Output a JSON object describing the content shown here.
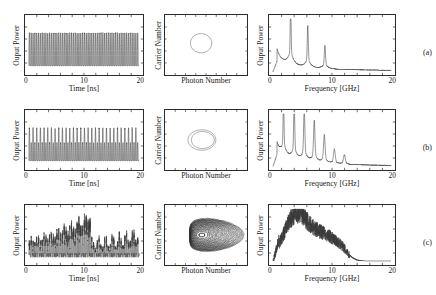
{
  "figure": {
    "panel_labels": [
      "(a)",
      "(b)",
      "(c)"
    ],
    "columns": [
      "time-series",
      "phase-portrait",
      "rf-spectrum"
    ]
  },
  "chart_data": [
    {
      "type": "line",
      "panel": "(a)",
      "column": "time-series",
      "title": "",
      "xlabel": "Time [ns]",
      "ylabel": "Ouput Power",
      "xlim": [
        0,
        20
      ],
      "xticks": [
        0,
        10,
        20
      ],
      "xticklabels": [
        "0",
        "10",
        "20"
      ],
      "yticks": [],
      "grid": false,
      "description": "Period-one limit-cycle oscillation, constant amplitude relaxation oscillation at about 3 GHz",
      "waveform": {
        "kind": "periodic",
        "freq_ghz": 3.0,
        "amplitude": 1.0,
        "amplitude_jitter": 0.04,
        "baseline": 0.42
      }
    },
    {
      "type": "scatter",
      "panel": "(a)",
      "column": "phase-portrait",
      "xlabel": "Photon Number",
      "ylabel": "Carrier Number",
      "grid": false,
      "description": "Single closed orbit (period-one limit cycle)",
      "orbit": {
        "kind": "loops",
        "loops": 1,
        "rx": 0.13,
        "ry": 0.16,
        "cx": 0.44,
        "cy": 0.47,
        "spread": 0.0
      }
    },
    {
      "type": "line",
      "panel": "(a)",
      "column": "rf-spectrum",
      "xlabel": "Frequency [GHz]",
      "ylabel": "Ouput Power",
      "xlim": [
        0,
        20
      ],
      "xticks": [
        0,
        10,
        20
      ],
      "xticklabels": [
        "0",
        "10",
        "20"
      ],
      "yticks": [],
      "grid": false,
      "description": "Sharp fundamental peak near 3 GHz with decaying harmonics at 6 and 9 GHz on a smooth decaying background",
      "peaks_ghz": [
        3.0,
        5.9,
        8.8
      ],
      "peak_heights": [
        0.95,
        0.62,
        0.34
      ],
      "background": "monotonic decay"
    },
    {
      "type": "line",
      "panel": "(b)",
      "column": "time-series",
      "title": "",
      "xlabel": "Time [ns]",
      "ylabel": "Ouput Power",
      "xlim": [
        0,
        20
      ],
      "xticks": [
        0,
        10,
        20
      ],
      "xticklabels": [
        "0",
        "10",
        "20"
      ],
      "yticks": [],
      "grid": false,
      "description": "Period-doubled oscillation, alternating tall and short pulses",
      "waveform": {
        "kind": "period-doubled",
        "freq_ghz": 3.0,
        "amplitude": 1.0,
        "alt_ratio": 0.55,
        "amplitude_jitter": 0.05,
        "baseline": 0.42
      }
    },
    {
      "type": "scatter",
      "panel": "(b)",
      "column": "phase-portrait",
      "xlabel": "Photon Number",
      "ylabel": "Carrier Number",
      "grid": false,
      "description": "Double-loop orbit characteristic of period-two dynamics",
      "orbit": {
        "kind": "loops",
        "loops": 2,
        "rx": 0.17,
        "ry": 0.17,
        "cx": 0.45,
        "cy": 0.5,
        "spread": 0.4
      }
    },
    {
      "type": "line",
      "panel": "(b)",
      "column": "rf-spectrum",
      "xlabel": "Frequency [GHz]",
      "ylabel": "Ouput Power",
      "xlim": [
        0,
        20
      ],
      "xticks": [
        0,
        10,
        20
      ],
      "xticklabels": [
        "0",
        "10",
        "20"
      ],
      "yticks": [],
      "grid": false,
      "description": "Comb of sharp peaks at half-integer multiples of the relaxation frequency, indicating period doubling",
      "peaks_ghz": [
        1.8,
        3.6,
        5.3,
        7.0,
        8.7,
        10.4,
        12.1
      ],
      "peak_heights": [
        0.9,
        0.88,
        0.8,
        0.62,
        0.42,
        0.22,
        0.14
      ],
      "background": "monotonic decay"
    },
    {
      "type": "line",
      "panel": "(c)",
      "column": "time-series",
      "title": "",
      "xlabel": "Time [ns]",
      "ylabel": "Ouput Power",
      "xlim": [
        0,
        20
      ],
      "xticks": [
        0,
        10,
        20
      ],
      "xticklabels": [
        "0",
        "10",
        "20"
      ],
      "yticks": [],
      "grid": false,
      "description": "Chaotic intensity pulsations with strongly irregular pulse heights",
      "waveform": {
        "kind": "chaotic",
        "freq_ghz": 3.0,
        "amplitude": 1.0,
        "amplitude_jitter": 0.55,
        "baseline": 0.45
      }
    },
    {
      "type": "scatter",
      "panel": "(c)",
      "column": "phase-portrait",
      "xlabel": "Photon Number",
      "ylabel": "Carrier Number",
      "grid": false,
      "description": "Dense chaotic attractor filling a broad banana-shaped region",
      "orbit": {
        "kind": "chaotic",
        "loops": 34,
        "rx": 0.3,
        "ry": 0.26,
        "cx": 0.46,
        "cy": 0.5,
        "spread": 1.0
      }
    },
    {
      "type": "line",
      "panel": "(c)",
      "column": "rf-spectrum",
      "xlabel": "Frequency [GHz]",
      "ylabel": "Ouput Power",
      "xlim": [
        0,
        20
      ],
      "xticks": [
        0,
        10,
        20
      ],
      "xticklabels": [
        "0",
        "10",
        "20"
      ],
      "yticks": [],
      "grid": false,
      "description": "Broadband noisy spectrum with a wide hump near 3-4 GHz rolling off above 12 GHz; no discrete peaks",
      "peaks_ghz": [],
      "peak_heights": [],
      "background": "broadband noise"
    }
  ]
}
